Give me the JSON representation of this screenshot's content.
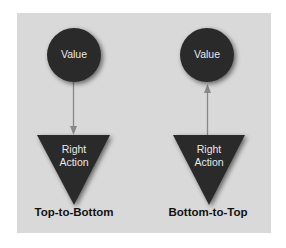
{
  "colors": {
    "panel_background": "#d9d9d9",
    "page_background": "#ffffff",
    "node_fill": "#2b2b2b",
    "node_text": "#e8e8e8",
    "arrow": "#888888",
    "label_text": "#111111"
  },
  "diagrams": [
    {
      "caption": "Top-to-Bottom",
      "top_node": {
        "shape": "circle",
        "text": "Value"
      },
      "bottom_node": {
        "shape": "inverted-triangle",
        "text_line1": "Right",
        "text_line2": "Action"
      },
      "arrow_direction": "down"
    },
    {
      "caption": "Bottom-to-Top",
      "top_node": {
        "shape": "circle",
        "text": "Value"
      },
      "bottom_node": {
        "shape": "inverted-triangle",
        "text_line1": "Right",
        "text_line2": "Action"
      },
      "arrow_direction": "up"
    }
  ]
}
